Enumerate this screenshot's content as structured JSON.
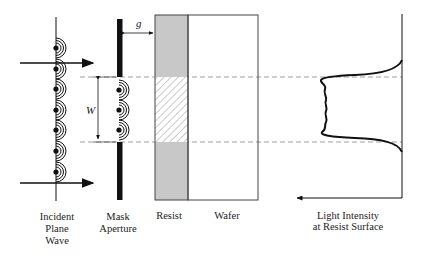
{
  "diagram": {
    "type": "proximity-lithography-diffraction",
    "labels": {
      "incident": [
        "Incident",
        "Plane",
        "Wave"
      ],
      "mask": [
        "Mask",
        "Aperture"
      ],
      "resist": "Resist",
      "wafer": "Wafer",
      "intensity": [
        "Light Intensity",
        "at Resist Surface"
      ],
      "gap_symbol": "g",
      "width_symbol": "W"
    },
    "colors": {
      "line": "#111111",
      "resist_fill": "#c8c8c8",
      "dash": "#888888"
    }
  }
}
